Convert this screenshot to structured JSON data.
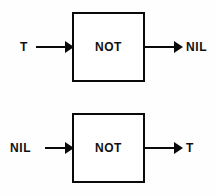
{
  "diagram": {
    "type": "logic-gate-truth-illustration",
    "background_color": "#ffffff",
    "line_color": "#0a0a0a",
    "text_color": "#111111",
    "gates": [
      {
        "id": "not-gate-true-input",
        "gate_label": "NOT",
        "input_label": "T",
        "output_label": "NIL"
      },
      {
        "id": "not-gate-nil-input",
        "gate_label": "NOT",
        "input_label": "NIL",
        "output_label": "T"
      }
    ]
  }
}
